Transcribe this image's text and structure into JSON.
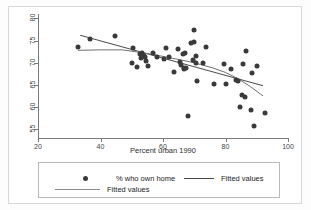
{
  "figure": {
    "background_color": "#ffffff",
    "border_color": "#d8d8d8",
    "axis_color": "#7a7a7a",
    "marker_color": "#3a3a3a",
    "line_color": "#4a4a4a"
  },
  "axis": {
    "x_title": "Percent urban 1990",
    "x_ticks": [
      "20",
      "40",
      "60",
      "80",
      "100"
    ],
    "y_ticks": [
      "55",
      "60",
      "65",
      "70",
      "75",
      "80"
    ]
  },
  "legend": {
    "scatter_label": "% who own home",
    "line1_label": "Fitted values",
    "line2_label": "Fitted values"
  },
  "chart_data": {
    "type": "scatter",
    "title": "",
    "xlabel": "Percent urban 1990",
    "ylabel": "",
    "xlim": [
      20,
      100
    ],
    "ylim": [
      53,
      81
    ],
    "grid": false,
    "legend_position": "below-plot",
    "series": [
      {
        "name": "% who own home",
        "type": "scatter",
        "points": [
          [
            32.8,
            73.5
          ],
          [
            36.7,
            75.3
          ],
          [
            44.7,
            76.0
          ],
          [
            50.2,
            70.0
          ],
          [
            50.5,
            73.3
          ],
          [
            51.8,
            69.0
          ],
          [
            52.6,
            71.9
          ],
          [
            52.9,
            71.1
          ],
          [
            53.4,
            72.3
          ],
          [
            53.8,
            71.5
          ],
          [
            54.2,
            71.2
          ],
          [
            54.6,
            70.3
          ],
          [
            55.1,
            69.3
          ],
          [
            56.9,
            72.3
          ],
          [
            58.2,
            71.3
          ],
          [
            60.3,
            70.9
          ],
          [
            60.8,
            73.4
          ],
          [
            62.0,
            71.2
          ],
          [
            63.6,
            67.8
          ],
          [
            64.9,
            73.0
          ],
          [
            65.5,
            70.2
          ],
          [
            65.9,
            69.4
          ],
          [
            66.3,
            71.9
          ],
          [
            66.6,
            68.9
          ],
          [
            66.8,
            68.6
          ],
          [
            67.1,
            72.1
          ],
          [
            67.4,
            68.9
          ],
          [
            68.0,
            58.0
          ],
          [
            69.1,
            74.4
          ],
          [
            69.6,
            70.7
          ],
          [
            69.9,
            77.4
          ],
          [
            70.0,
            74.7
          ],
          [
            70.4,
            71.5
          ],
          [
            70.6,
            69.9
          ],
          [
            70.9,
            65.9
          ],
          [
            72.8,
            70.0
          ],
          [
            73.9,
            73.5
          ],
          [
            76.3,
            65.2
          ],
          [
            79.5,
            69.8
          ],
          [
            80.0,
            65.3
          ],
          [
            81.9,
            68.6
          ],
          [
            83.3,
            66.0
          ],
          [
            83.9,
            65.8
          ],
          [
            84.6,
            60.1
          ],
          [
            85.2,
            62.6
          ],
          [
            85.6,
            69.7
          ],
          [
            86.2,
            62.3
          ],
          [
            86.5,
            72.6
          ],
          [
            88.2,
            59.3
          ],
          [
            88.6,
            67.6
          ],
          [
            89.0,
            55.8
          ],
          [
            90.2,
            69.2
          ],
          [
            92.6,
            58.6
          ]
        ]
      },
      {
        "name": "Fitted values",
        "type": "line",
        "points": [
          [
            33.5,
            76.2
          ],
          [
            92.0,
            64.8
          ]
        ]
      },
      {
        "name": "Fitted values",
        "type": "line",
        "points": [
          [
            32.8,
            72.8
          ],
          [
            40.0,
            72.9
          ],
          [
            47.0,
            72.9
          ],
          [
            53.0,
            72.3
          ],
          [
            58.0,
            71.7
          ],
          [
            63.0,
            71.0
          ],
          [
            68.0,
            70.3
          ],
          [
            72.0,
            69.6
          ],
          [
            76.0,
            68.8
          ],
          [
            80.0,
            67.8
          ],
          [
            84.0,
            66.4
          ],
          [
            88.0,
            64.6
          ],
          [
            92.0,
            62.5
          ]
        ]
      }
    ]
  }
}
